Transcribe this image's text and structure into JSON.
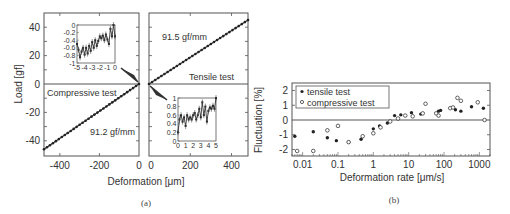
{
  "figure": {
    "caption_a": "(a)",
    "caption_b": "(b)"
  },
  "chart_data": [
    {
      "id": "a-left",
      "type": "line",
      "title": "Compressive test",
      "xlabel": "Deformation [μm]",
      "ylabel": "Load [gf]",
      "xlim": [
        -480,
        0
      ],
      "ylim": [
        -50,
        50
      ],
      "xticks": [
        "-400",
        "-200",
        "0"
      ],
      "yticks": [
        "40",
        "20",
        "0",
        "-20",
        "-40"
      ],
      "annotation_slope": "91.2 gf/mm",
      "label": "Compressive test",
      "x": [
        -480,
        0
      ],
      "y": [
        -46,
        0
      ],
      "inset": {
        "xlim": [
          -5,
          0
        ],
        "ylim": [
          -1,
          0
        ],
        "xticks": [
          "-5",
          "-4",
          "-3",
          "-2",
          "-1",
          "0"
        ],
        "yticks": [
          "0",
          "-0.2",
          "-0.4",
          "-0.6",
          "-0.8",
          "-1"
        ],
        "x": [
          -5,
          -4.8,
          -4.6,
          -4.4,
          -4.2,
          -4.0,
          -3.8,
          -3.6,
          -3.4,
          -3.2,
          -3.0,
          -2.8,
          -2.6,
          -2.4,
          -2.2,
          -2.0,
          -1.8,
          -1.6,
          -1.4,
          -1.2,
          -1.0,
          -0.8,
          -0.6,
          -0.4,
          -0.2,
          0
        ],
        "y": [
          -0.5,
          -0.65,
          -0.85,
          -0.7,
          -0.6,
          -0.78,
          -0.6,
          -0.75,
          -0.55,
          -0.68,
          -0.45,
          -0.6,
          -0.4,
          -0.55,
          -0.42,
          -0.3,
          -0.35,
          -0.28,
          -0.4,
          -0.25,
          -0.38,
          -0.5,
          -0.1,
          -0.3,
          0.0,
          -0.3
        ]
      }
    },
    {
      "id": "a-right",
      "type": "line",
      "title": "Tensile test",
      "xlabel": "Deformation [μm]",
      "ylabel": "Load [gf]",
      "xlim": [
        0,
        480
      ],
      "ylim": [
        -50,
        50
      ],
      "xticks": [
        "0",
        "200",
        "400"
      ],
      "annotation_slope": "91.5 gf/mm",
      "label": "Tensile test",
      "x": [
        0,
        480
      ],
      "y": [
        0,
        45
      ],
      "inset": {
        "xlim": [
          0,
          5
        ],
        "ylim": [
          0,
          1
        ],
        "xticks": [
          "0",
          "1",
          "2",
          "3",
          "4",
          "5"
        ],
        "yticks": [
          "1",
          "0.8",
          "0.6",
          "0.4",
          "0.2",
          "0"
        ],
        "x": [
          0,
          0.2,
          0.4,
          0.6,
          0.8,
          1.0,
          1.2,
          1.4,
          1.6,
          1.8,
          2.0,
          2.2,
          2.4,
          2.6,
          2.8,
          3.0,
          3.2,
          3.4,
          3.6,
          3.8,
          4.0,
          4.2,
          4.4,
          4.6,
          4.8,
          5.0
        ],
        "y": [
          0.2,
          0.5,
          0.6,
          0.45,
          0.55,
          0.35,
          0.6,
          0.5,
          0.55,
          0.5,
          0.6,
          0.65,
          0.5,
          0.6,
          0.75,
          0.55,
          0.9,
          0.6,
          0.8,
          0.45,
          0.7,
          0.78,
          0.75,
          0.82,
          0.75,
          1.0
        ]
      }
    },
    {
      "id": "b",
      "type": "scatter",
      "xscale": "log",
      "xlabel": "Deformation rate [μm/s]",
      "ylabel": "Fluctuation [%]",
      "xlim": [
        0.005,
        2000
      ],
      "ylim": [
        -2.5,
        2.5
      ],
      "xticks": [
        "0.01",
        "0.1",
        "1",
        "10",
        "100",
        "1000"
      ],
      "yticks": [
        "2",
        "1",
        "0",
        "-1",
        "-2"
      ],
      "legend": {
        "position": "upper left",
        "entries": [
          "tensile test",
          "compressive test"
        ]
      },
      "series": [
        {
          "name": "tensile test",
          "marker": "filled-circle",
          "x": [
            0.006,
            0.02,
            0.05,
            0.09,
            0.2,
            0.45,
            1.0,
            1.5,
            2.5,
            4,
            6,
            12,
            22,
            70,
            80,
            210,
            300,
            600,
            1300
          ],
          "y": [
            -1.1,
            -0.8,
            -1.2,
            -1.4,
            -1.5,
            -1.3,
            -0.6,
            -0.4,
            -0.2,
            0.3,
            0.35,
            0.5,
            0.4,
            0.6,
            0.65,
            0.7,
            0.6,
            0.9,
            0.8
          ]
        },
        {
          "name": "compressive test",
          "marker": "open-circle",
          "x": [
            0.007,
            0.02,
            0.05,
            0.1,
            0.2,
            0.5,
            1.0,
            1.6,
            3,
            5,
            8,
            13,
            25,
            30,
            60,
            70,
            150,
            180,
            240,
            300,
            900,
            1400
          ],
          "y": [
            -2.1,
            -2.1,
            -0.7,
            -0.4,
            -1.5,
            -1.1,
            -0.9,
            -0.5,
            -0.1,
            0.1,
            0.3,
            0.25,
            0.45,
            1.1,
            0.45,
            0.3,
            0.8,
            0.85,
            1.5,
            1.3,
            1.2,
            0.0
          ]
        }
      ]
    }
  ]
}
